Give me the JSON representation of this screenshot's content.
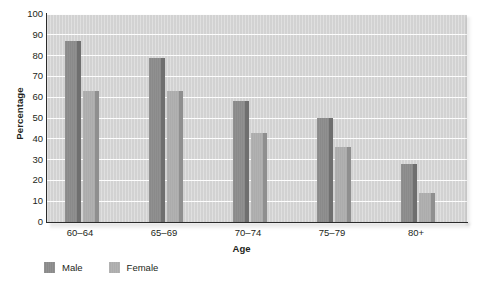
{
  "chart_data": {
    "type": "bar",
    "title": "",
    "subtitle": "",
    "xlabel": "Age",
    "ylabel": "Percentage",
    "categories": [
      "60–64",
      "65–69",
      "70–74",
      "75–79",
      "80+"
    ],
    "series": [
      {
        "name": "Male",
        "color": "#8a8a8a",
        "values": [
          87,
          79,
          58,
          50,
          28
        ]
      },
      {
        "name": "Female",
        "color": "#acacac",
        "values": [
          63,
          63,
          43,
          36,
          14
        ]
      }
    ],
    "ylim": [
      0,
      100
    ],
    "ytick_step": 10,
    "yticks": [
      "100",
      "90",
      "80",
      "70",
      "60",
      "50",
      "40",
      "30",
      "20",
      "10",
      "0"
    ],
    "grid": "horizontal",
    "legend_position": "bottom-left",
    "plot_background": "#d2d2d2",
    "gridline_color": "#fdfdfd",
    "axis_color": "#2b2b2b"
  },
  "legend": {
    "items": [
      {
        "label": "Male",
        "swatch": "male-color-swatch"
      },
      {
        "label": "Female",
        "swatch": "female-color-swatch"
      }
    ]
  }
}
